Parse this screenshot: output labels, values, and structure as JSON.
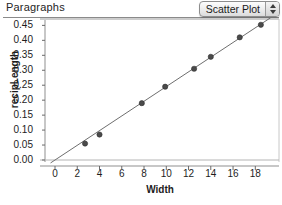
{
  "header": {
    "label": "Paragraphs"
  },
  "plot_type_select": {
    "value": "Scatter Plot",
    "stepper_up_icon": "arrow-up-icon",
    "stepper_down_icon": "arrow-down-icon"
  },
  "chart_data": {
    "type": "scatter",
    "title": "",
    "xlabel": "Width",
    "ylabel": "recipLength",
    "xlim": [
      -1.5,
      19.5
    ],
    "ylim": [
      -0.012,
      0.468
    ],
    "grid": false,
    "legend": null,
    "x_ticks": [
      0,
      2,
      4,
      6,
      8,
      10,
      12,
      14,
      16,
      18
    ],
    "x_tick_labels": [
      "0",
      "2",
      "4",
      "6",
      "8",
      "10",
      "12",
      "14",
      "16",
      "18"
    ],
    "y_ticks": [
      0.0,
      0.05,
      0.1,
      0.15,
      0.2,
      0.25,
      0.3,
      0.35,
      0.4,
      0.45
    ],
    "y_tick_labels": [
      "0.00",
      "0.05",
      "0.10",
      "0.15",
      "0.20",
      "0.25",
      "0.30",
      "0.35",
      "0.40",
      "0.45"
    ],
    "marker_color": "#4a4a4a",
    "line_color": "#6e6e6e",
    "points": [
      {
        "x": 2.7,
        "y": 0.055
      },
      {
        "x": 4.0,
        "y": 0.085
      },
      {
        "x": 7.8,
        "y": 0.19
      },
      {
        "x": 9.9,
        "y": 0.245
      },
      {
        "x": 12.5,
        "y": 0.305
      },
      {
        "x": 14.0,
        "y": 0.345
      },
      {
        "x": 16.6,
        "y": 0.41
      },
      {
        "x": 18.5,
        "y": 0.452
      }
    ],
    "fit_line": {
      "type": "linear",
      "slope": 0.02455,
      "intercept": 0.0,
      "x_start": -0.4,
      "x_end": 19.4
    }
  }
}
